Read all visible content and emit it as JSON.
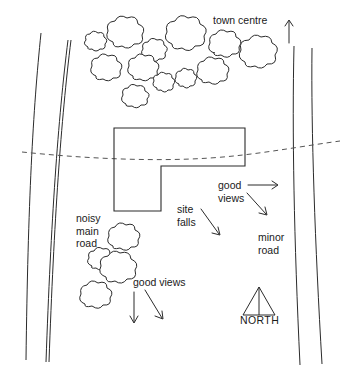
{
  "diagram": {
    "background_color": "#ffffff",
    "ink_color": "#2b2b2b",
    "contour_color": "#555555"
  },
  "labels": {
    "town_centre": "town centre",
    "noisy_main_road": "noisy\nmain\nroad",
    "site_falls": "site\nfalls",
    "good_views_right": "good\nviews",
    "minor_road": "minor\nroad",
    "good_views_bottom": "good views",
    "north": "NORTH"
  },
  "features": {
    "roads": [
      {
        "name": "noisy-main-road",
        "side": "left",
        "line_count": 3
      },
      {
        "name": "minor-road",
        "side": "right",
        "line_count": 2
      }
    ],
    "tree_clusters": [
      {
        "name": "upper-tree-cluster",
        "count": 14
      },
      {
        "name": "lower-left-tree-cluster",
        "count": 4
      }
    ],
    "site_boundary": {
      "name": "site-outline",
      "shape": "L-shaped"
    },
    "contour_line": {
      "name": "contour-line",
      "style": "dashed"
    },
    "compass": {
      "name": "north-compass",
      "direction": "up"
    }
  },
  "arrows": [
    {
      "name": "town-centre-arrow",
      "direction": "up"
    },
    {
      "name": "good-views-right-arrow",
      "direction": "right"
    },
    {
      "name": "good-views-down-right-arrow",
      "direction": "down-right"
    },
    {
      "name": "site-falls-arrow",
      "direction": "down-right"
    },
    {
      "name": "good-views-down-arrow",
      "direction": "down"
    },
    {
      "name": "good-views-bottom-down-right-arrow",
      "direction": "down-right"
    }
  ]
}
